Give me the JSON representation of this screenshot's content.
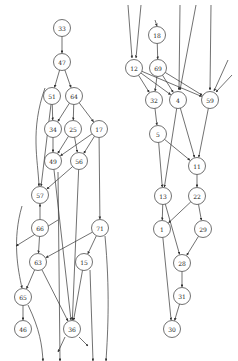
{
  "diagram": {
    "type": "directed-graph",
    "node_radius": 8.5,
    "stroke_color": "#333333",
    "background": "#ffffff",
    "nodes": [
      {
        "id": "33",
        "x": 62,
        "y": 28
      },
      {
        "id": "47",
        "x": 62,
        "y": 62
      },
      {
        "id": "51",
        "x": 52,
        "y": 96
      },
      {
        "id": "64",
        "x": 74,
        "y": 96
      },
      {
        "id": "34",
        "x": 53,
        "y": 129
      },
      {
        "id": "25",
        "x": 73,
        "y": 129
      },
      {
        "id": "17",
        "x": 99,
        "y": 129
      },
      {
        "id": "49",
        "x": 53,
        "y": 161
      },
      {
        "id": "56",
        "x": 79,
        "y": 161
      },
      {
        "id": "57",
        "x": 40,
        "y": 195
      },
      {
        "id": "66",
        "x": 40,
        "y": 228
      },
      {
        "id": "71",
        "x": 100,
        "y": 228
      },
      {
        "id": "63",
        "x": 38,
        "y": 262
      },
      {
        "id": "15",
        "x": 84,
        "y": 262
      },
      {
        "id": "65",
        "x": 23,
        "y": 297
      },
      {
        "id": "46",
        "x": 23,
        "y": 329
      },
      {
        "id": "36",
        "x": 72,
        "y": 329
      },
      {
        "id": "18",
        "x": 157,
        "y": 35
      },
      {
        "id": "12",
        "x": 134,
        "y": 68
      },
      {
        "id": "69",
        "x": 158,
        "y": 68
      },
      {
        "id": "32",
        "x": 154,
        "y": 100
      },
      {
        "id": "4",
        "x": 178,
        "y": 100
      },
      {
        "id": "59",
        "x": 210,
        "y": 100
      },
      {
        "id": "5",
        "x": 158,
        "y": 134
      },
      {
        "id": "11",
        "x": 197,
        "y": 166
      },
      {
        "id": "13",
        "x": 163,
        "y": 196
      },
      {
        "id": "22",
        "x": 197,
        "y": 196
      },
      {
        "id": "1",
        "x": 162,
        "y": 229
      },
      {
        "id": "29",
        "x": 203,
        "y": 229
      },
      {
        "id": "28",
        "x": 182,
        "y": 263
      },
      {
        "id": "31",
        "x": 182,
        "y": 296
      },
      {
        "id": "30",
        "x": 172,
        "y": 329
      }
    ],
    "edges": [
      {
        "from": "33",
        "to": "47"
      },
      {
        "from": "47",
        "to": "51"
      },
      {
        "from": "47",
        "to": "64"
      },
      {
        "from": "51",
        "to": "34"
      },
      {
        "from": "64",
        "to": "34"
      },
      {
        "from": "64",
        "to": "25"
      },
      {
        "from": "64",
        "to": "17"
      },
      {
        "from": "34",
        "to": "49"
      },
      {
        "from": "25",
        "to": "49"
      },
      {
        "from": "25",
        "to": "56"
      },
      {
        "from": "17",
        "to": "49"
      },
      {
        "from": "17",
        "to": "56"
      },
      {
        "from": "17",
        "to": "71"
      },
      {
        "from": "51",
        "to": "57"
      },
      {
        "from": "56",
        "to": "57"
      },
      {
        "from": "66",
        "to": "57"
      },
      {
        "from": "66",
        "to": "63"
      },
      {
        "from": "71",
        "to": "63"
      },
      {
        "from": "71",
        "to": "15"
      },
      {
        "from": "63",
        "to": "65"
      },
      {
        "from": "63",
        "to": "36"
      },
      {
        "from": "65",
        "to": "46"
      },
      {
        "from": "49",
        "to": "36"
      },
      {
        "from": "56",
        "to": "36"
      },
      {
        "from": "15",
        "to": "36"
      },
      {
        "from": "18",
        "to": "69"
      },
      {
        "from": "12",
        "to": "32"
      },
      {
        "from": "12",
        "to": "4"
      },
      {
        "from": "12",
        "to": "59"
      },
      {
        "from": "69",
        "to": "32"
      },
      {
        "from": "69",
        "to": "4"
      },
      {
        "from": "69",
        "to": "59"
      },
      {
        "from": "32",
        "to": "5"
      },
      {
        "from": "5",
        "to": "11"
      },
      {
        "from": "5",
        "to": "13"
      },
      {
        "from": "4",
        "to": "13"
      },
      {
        "from": "4",
        "to": "11"
      },
      {
        "from": "59",
        "to": "11"
      },
      {
        "from": "11",
        "to": "22"
      },
      {
        "from": "13",
        "to": "1"
      },
      {
        "from": "22",
        "to": "1"
      },
      {
        "from": "22",
        "to": "29"
      },
      {
        "from": "13",
        "to": "28"
      },
      {
        "from": "29",
        "to": "28"
      },
      {
        "from": "28",
        "to": "31"
      },
      {
        "from": "31",
        "to": "30"
      },
      {
        "from": "1",
        "to": "30"
      }
    ],
    "dangling_edges": [
      {
        "path": "M 128 5 L 132 58"
      },
      {
        "path": "M 141 5 L 136 58"
      },
      {
        "path": "M 155 20 L 157 26"
      },
      {
        "path": "M 180 5 L 179 90"
      },
      {
        "path": "M 196 5 L 180 90"
      },
      {
        "path": "M 211 5 L 210 90"
      },
      {
        "path": "M 228 60 L 214 91"
      },
      {
        "path": "M 232 75 L 216 92"
      },
      {
        "path": "M 45 88 C 30 130, 38 160, 39 186"
      },
      {
        "path": "M 58 220 L 16 246"
      },
      {
        "path": "M 22 206 C 12 240, 18 270, 22 288"
      },
      {
        "path": "M 28 305 C 40 330, 42 345, 43 361"
      },
      {
        "path": "M 58 172 L 60 361"
      },
      {
        "path": "M 90 270 L 93 361"
      },
      {
        "path": "M 105 236 C 110 290, 108 330, 106 361"
      },
      {
        "path": "M 65 337 L 58 352"
      },
      {
        "path": "M 79 337 L 88 346"
      }
    ]
  }
}
